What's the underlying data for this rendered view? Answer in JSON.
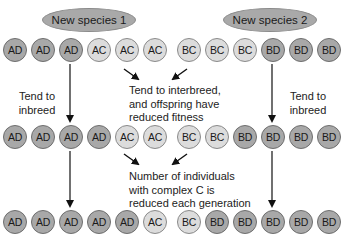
{
  "species": [
    {
      "label": "New species 1"
    },
    {
      "label": "New species 2"
    }
  ],
  "generations": [
    {
      "cells": [
        "AD",
        "AD",
        "AD",
        "AC",
        "AC",
        "AC",
        "BC",
        "BC",
        "BC",
        "BD",
        "BD",
        "BD"
      ]
    },
    {
      "cells": [
        "AD",
        "AD",
        "AD",
        "AD",
        "AC",
        "AC",
        "BC",
        "BC",
        "BD",
        "BD",
        "BD",
        "BD"
      ]
    },
    {
      "cells": [
        "AD",
        "AD",
        "AD",
        "AD",
        "AD",
        "AC",
        "BC",
        "BD",
        "BD",
        "BD",
        "BD",
        "BD"
      ]
    }
  ],
  "labels": {
    "left_inbreed": [
      "Tend to",
      "inbreed"
    ],
    "right_inbreed": [
      "Tend to",
      "inbreed"
    ],
    "interbreed": [
      "Tend to interbreed,",
      "and offspring have",
      "reduced fitness"
    ],
    "reduction": [
      "Number of individuals",
      "with complex C is",
      "reduced each generation"
    ]
  },
  "colors": {
    "dark_complex": "#a8a8a8",
    "light_complex": "#dcdcdc",
    "oval": "#a9a9a9",
    "arrow": "#111111"
  }
}
